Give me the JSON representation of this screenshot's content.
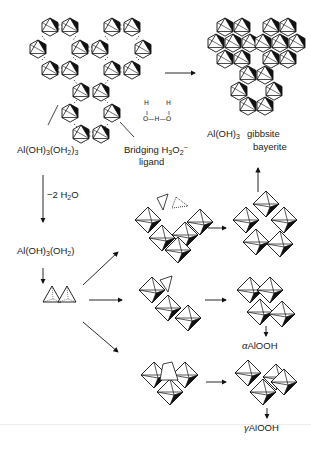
{
  "diagram": {
    "nodes": {
      "monomer_hydrate": {
        "label": "Al(OH)",
        "sub1": "3",
        "mid": "(OH",
        "sub2": "2",
        "end": ")",
        "sub3": "3"
      },
      "bridging": {
        "label": "Bridging H",
        "sub": "3",
        "o": "O",
        "osub": "2",
        "osup": "−",
        "line2": "ligand"
      },
      "h3o2_structure": {
        "h_left": "H",
        "h_right": "H",
        "chain": "O—H—O"
      },
      "gibbsite": {
        "formula": "Al(OH)",
        "sub": "3",
        "name1": "gibbsite",
        "name2": "bayerite"
      },
      "dehydration": {
        "label": "−2 H",
        "sub": "2",
        "end": "O"
      },
      "monomer_partial": {
        "label": "Al(OH)",
        "sub1": "3",
        "mid": "(OH",
        "sub2": "2",
        "end": ")"
      },
      "alpha": {
        "prefix": "α",
        "label": "AlOOH"
      },
      "gamma": {
        "prefix": "γ",
        "label": "AlOOH"
      }
    },
    "arrows": [
      {
        "from": "hexagonal-rings",
        "to": "gibbsite-sheet",
        "direction": "right"
      },
      {
        "from": "hexagonal-rings",
        "to": "monomer-partial",
        "direction": "down",
        "label": "-2 H2O"
      },
      {
        "from": "monomer-partial",
        "to": "tetrahedra",
        "direction": "down"
      },
      {
        "from": "tetrahedra",
        "to": "octahedra-top",
        "direction": "up-right"
      },
      {
        "from": "tetrahedra",
        "to": "octahedra-middle",
        "direction": "right"
      },
      {
        "from": "tetrahedra",
        "to": "octahedra-bottom",
        "direction": "down-right"
      },
      {
        "from": "octahedra-top-product",
        "to": "gibbsite-sheet",
        "direction": "up"
      },
      {
        "from": "octahedra-middle-product",
        "to": "alpha-AlOOH",
        "direction": "down"
      },
      {
        "from": "octahedra-bottom-product",
        "to": "gamma-AlOOH",
        "direction": "down"
      }
    ],
    "colors": {
      "ink": "#111111",
      "paper": "#ffffff",
      "fill_dark": "#000000"
    }
  }
}
